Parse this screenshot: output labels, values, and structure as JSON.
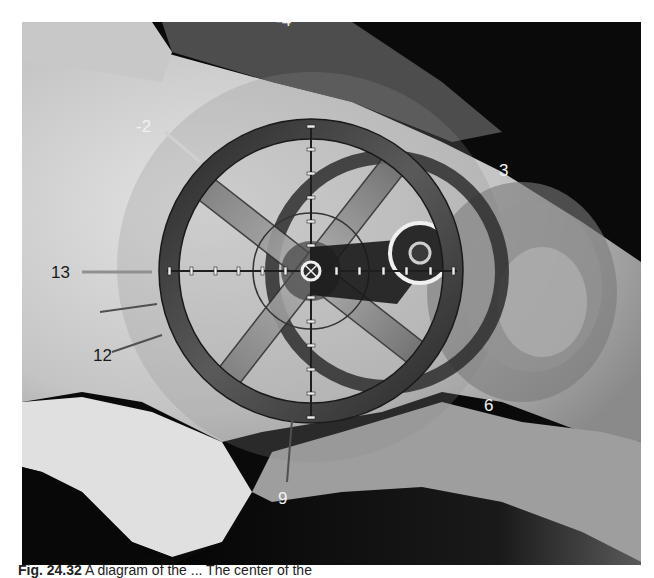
{
  "figure": {
    "labels": [
      {
        "id": "minus4",
        "text": "-4",
        "x": 276,
        "y": 10,
        "tone": "light"
      },
      {
        "id": "minus2",
        "text": "-2",
        "x": 136,
        "y": 118,
        "tone": "light"
      },
      {
        "id": "three",
        "text": "3",
        "x": 499,
        "y": 162,
        "tone": "light"
      },
      {
        "id": "thirteen",
        "text": "13",
        "x": 51,
        "y": 264,
        "tone": "dark"
      },
      {
        "id": "twelve",
        "text": "12",
        "x": 93,
        "y": 347,
        "tone": "dark"
      },
      {
        "id": "six",
        "text": "6",
        "x": 484,
        "y": 397,
        "tone": "light"
      },
      {
        "id": "nine",
        "text": "9",
        "x": 278,
        "y": 490,
        "tone": "light"
      }
    ],
    "colors": {
      "background_dark": "#0a0a0a",
      "bone_light": "#d8d8d8",
      "bone_mid": "#a8a8a8",
      "ring_dark": "#3a3a3a",
      "crosshair": "#1e1e1e",
      "tick_light": "#eeeeee"
    }
  },
  "caption": {
    "fig_number": "Fig. 24.32",
    "text": "A diagram of the ... The center of the"
  }
}
